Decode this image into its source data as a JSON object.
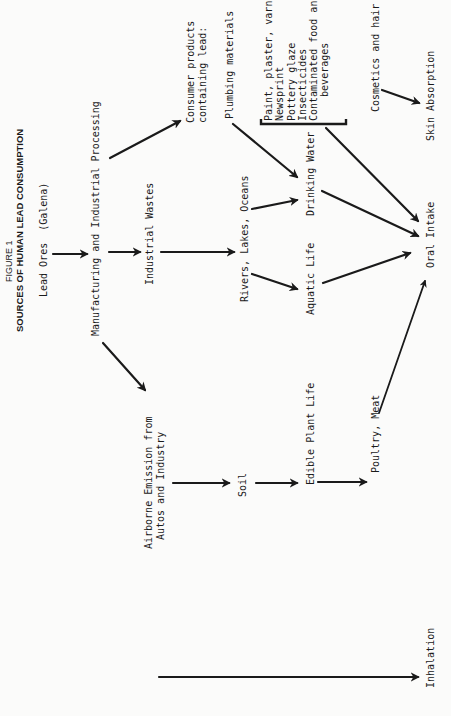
{
  "figure": {
    "label": "FIGURE 1",
    "title": "SOURCES OF HUMAN LEAD CONSUMPTION"
  },
  "nodes": {
    "lead_ores": "Lead Ores  (Galena)",
    "manufacturing": "Manufacturing and Industrial Processing",
    "industrial_wastes": "Industrial Wastes",
    "rivers": "Rivers, Lakes, Oceans",
    "consumer_products_line1": "Consumer products",
    "consumer_products_line2": "containing lead:",
    "plumbing": "Plumbing materials",
    "drinking_water": "Drinking Water",
    "aquatic_life": "Aquatic Life",
    "consumer_list": [
      "Paint, plaster, varnish",
      "Newsprint",
      "Pottery glaze",
      "Insecticides",
      "Contaminated food and",
      "    beverages"
    ],
    "cosmetics": "Cosmetics and hair dyes",
    "skin_absorption": "Skin Absorption",
    "oral_intake": "Oral Intake",
    "airborne_line1": "Airborne Emission from",
    "airborne_line2": "Autos and Industry",
    "soil": "Soil",
    "edible_plant_life": "Edible Plant Life",
    "poultry_meat": "Poultry, Meat",
    "inhalation": "Inhalation"
  },
  "edges": [
    {
      "from": "Lead Ores",
      "to": "Manufacturing and Industrial Processing"
    },
    {
      "from": "Manufacturing and Industrial Processing",
      "to": "Industrial Wastes"
    },
    {
      "from": "Manufacturing and Industrial Processing",
      "to": "Consumer products containing lead"
    },
    {
      "from": "Manufacturing and Industrial Processing",
      "to": "Airborne Emission from Autos and Industry"
    },
    {
      "from": "Industrial Wastes",
      "to": "Rivers, Lakes, Oceans"
    },
    {
      "from": "Rivers, Lakes, Oceans",
      "to": "Drinking Water"
    },
    {
      "from": "Rivers, Lakes, Oceans",
      "to": "Aquatic Life"
    },
    {
      "from": "Plumbing materials",
      "to": "Drinking Water"
    },
    {
      "from": "Drinking Water",
      "to": "Oral Intake"
    },
    {
      "from": "Aquatic Life",
      "to": "Oral Intake"
    },
    {
      "from": "Consumer product list",
      "to": "Oral Intake"
    },
    {
      "from": "Cosmetics and hair dyes",
      "to": "Skin Absorption"
    },
    {
      "from": "Airborne Emission from Autos and Industry",
      "to": "Soil"
    },
    {
      "from": "Soil",
      "to": "Edible Plant Life"
    },
    {
      "from": "Edible Plant Life",
      "to": "Poultry, Meat"
    },
    {
      "from": "Poultry, Meat",
      "to": "Oral Intake"
    },
    {
      "from": "Airborne Emission from Autos and Industry",
      "to": "Inhalation"
    }
  ],
  "colors": {
    "ink": "#1a1a1a",
    "paper": "#fbfbfa"
  }
}
